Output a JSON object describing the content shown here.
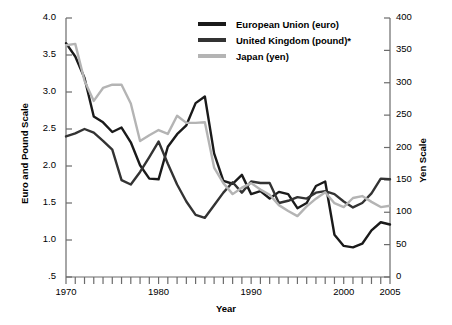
{
  "chart_data": {
    "type": "line",
    "title": "",
    "xlabel": "Year",
    "ylabel": "Euro and Pound Scale",
    "ylabel_right": "Yen Scale",
    "xlim": [
      1970,
      2005
    ],
    "ylim": [
      0.5,
      4.0
    ],
    "ylim_right": [
      0,
      400
    ],
    "grid": false,
    "legend_position": "top-center",
    "x_ticks": [
      1970,
      1980,
      1990,
      2000,
      2005
    ],
    "x_tick_labels": [
      "1970",
      "1980",
      "1990",
      "2000",
      "2005"
    ],
    "x_minor_ticks_every": 1,
    "y_ticks_left": [
      0.5,
      1.0,
      1.5,
      2.0,
      2.5,
      3.0,
      3.5,
      4.0
    ],
    "y_tick_labels_left": [
      ".5",
      "1.0",
      "1.5",
      "2.0",
      "2.5",
      "3.0",
      "3.5",
      "4.0"
    ],
    "y_ticks_right": [
      0,
      50,
      100,
      150,
      200,
      250,
      300,
      350,
      400
    ],
    "y_tick_labels_right": [
      "0",
      "50",
      "100",
      "150",
      "200",
      "250",
      "300",
      "350",
      "400"
    ],
    "x": [
      1970,
      1971,
      1972,
      1973,
      1974,
      1975,
      1976,
      1977,
      1978,
      1979,
      1980,
      1981,
      1982,
      1983,
      1984,
      1985,
      1986,
      1987,
      1988,
      1989,
      1990,
      1991,
      1992,
      1993,
      1994,
      1995,
      1996,
      1997,
      1998,
      1999,
      2000,
      2001,
      2002,
      2003,
      2004,
      2005
    ],
    "series": [
      {
        "name": "European Union (euro)",
        "axis": "left",
        "color": "#1a1a1a",
        "values": [
          3.66,
          3.48,
          3.19,
          2.67,
          2.59,
          2.46,
          2.52,
          2.32,
          2.01,
          1.83,
          1.82,
          2.26,
          2.43,
          2.55,
          2.85,
          2.94,
          2.17,
          1.8,
          1.76,
          1.88,
          1.62,
          1.66,
          1.56,
          1.65,
          1.62,
          1.43,
          1.5,
          1.73,
          1.79,
          1.07,
          0.92,
          0.9,
          0.95,
          1.13,
          1.24,
          1.21
        ]
      },
      {
        "name": "United Kingdom (pound)*",
        "axis": "left",
        "color": "#333333",
        "values": [
          2.4,
          2.44,
          2.5,
          2.45,
          2.34,
          2.22,
          1.81,
          1.75,
          1.92,
          2.12,
          2.33,
          2.03,
          1.75,
          1.52,
          1.34,
          1.3,
          1.47,
          1.64,
          1.78,
          1.64,
          1.79,
          1.77,
          1.77,
          1.5,
          1.53,
          1.58,
          1.56,
          1.64,
          1.66,
          1.62,
          1.52,
          1.44,
          1.5,
          1.63,
          1.83,
          1.82
        ]
      },
      {
        "name": "Japan (yen)",
        "axis": "right",
        "color": "#b4b4b4",
        "values": [
          358,
          360,
          303,
          272,
          292,
          297,
          297,
          268,
          210,
          219,
          227,
          221,
          249,
          238,
          238,
          239,
          169,
          145,
          128,
          138,
          145,
          135,
          127,
          111,
          102,
          94,
          109,
          121,
          131,
          114,
          108,
          122,
          125,
          116,
          108,
          110
        ]
      }
    ]
  },
  "axes": {
    "left_title": "Euro and Pound Scale",
    "right_title": "Yen Scale",
    "x_title": "Year"
  },
  "legend": {
    "items": [
      {
        "label": "European Union (euro)",
        "color": "#1a1a1a"
      },
      {
        "label": "United Kingdom (pound)*",
        "color": "#333333"
      },
      {
        "label": "Japan (yen)",
        "color": "#b4b4b4"
      }
    ]
  }
}
